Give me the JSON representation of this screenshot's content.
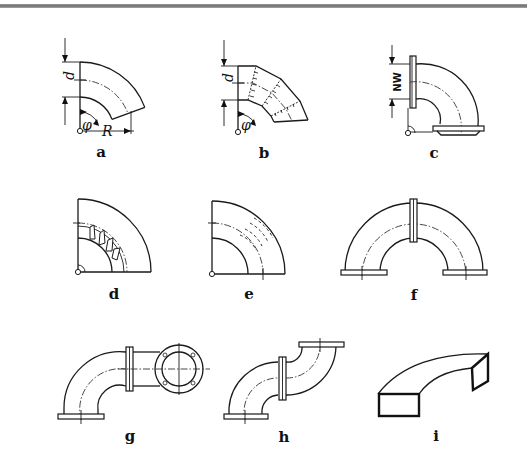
{
  "figure": {
    "panels": [
      {
        "id": "a",
        "label": "a",
        "description": "Pipe bend with dimensions d, φ, R"
      },
      {
        "id": "b",
        "label": "b",
        "description": "Segmented (welded) pipe bend with d and φ"
      },
      {
        "id": "c",
        "label": "c",
        "description": "Flanged 90° bend with nominal width NW"
      },
      {
        "id": "d",
        "label": "d",
        "description": "Bend with internal guide vanes"
      },
      {
        "id": "e",
        "label": "e",
        "description": "Bend with internal dashed guide lines"
      },
      {
        "id": "f",
        "label": "f",
        "description": "180° return bend of two flanged elbows"
      },
      {
        "id": "g",
        "label": "g",
        "description": "Flanged elbow combination with out-of-plane outlet"
      },
      {
        "id": "h",
        "label": "h",
        "description": "S-offset of two flanged elbows"
      },
      {
        "id": "i",
        "label": "i",
        "description": "Rectangular duct bend"
      }
    ],
    "dimension_symbols": {
      "a_d": "d",
      "a_phi": "φ",
      "a_R": "R",
      "b_d": "d",
      "b_phi": "φ",
      "c_nw": "NW"
    }
  },
  "colors": {
    "line": "#1a1a1a",
    "background": "#ffffff",
    "top_rule": "#7a7a7a"
  }
}
